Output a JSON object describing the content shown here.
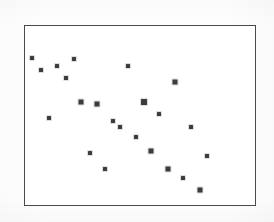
{
  "figure": {
    "background_color": "#fefefe",
    "width": 274,
    "height": 222
  },
  "plot": {
    "frame_color": "#4a4a4a",
    "frame_line_width": 1,
    "plot_background": "#ffffff",
    "marker_color": "#3c3c3c",
    "marker_shape": "square",
    "marker_size": 4,
    "frame_box": {
      "left": 24,
      "top": 25,
      "width": 232,
      "height": 181
    }
  },
  "chart_data": {
    "type": "scatter",
    "title": "",
    "subtitle": "",
    "xlabel": "",
    "ylabel": "",
    "grid": false,
    "legend": false,
    "legend_position": "none",
    "xlim": [
      0,
      100
    ],
    "ylim": [
      0,
      100
    ],
    "xticks": [],
    "yticks": [],
    "xticklabels": [],
    "yticklabels": [],
    "annotations": [],
    "n_points": 23,
    "series": [
      {
        "name": "observations",
        "color": "#3c3c3c",
        "marker": "square",
        "x": [
          3.2,
          6.8,
          13.9,
          21.0,
          17.7,
          44.5,
          64.8,
          24.1,
          31.0,
          51.4,
          10.2,
          38.1,
          41.0,
          57.9,
          48.0,
          71.4,
          27.9,
          54.4,
          78.3,
          34.6,
          61.5,
          68.2,
          75.3
        ],
        "y": [
          82.5,
          75.8,
          77.9,
          81.8,
          71.4,
          77.9,
          68.9,
          57.9,
          56.7,
          57.1,
          48.8,
          38.0,
          34.6,
          41.7,
          28.0,
          34.3,
          14.6,
          15.5,
          12.9,
          5.5,
          4.6,
          0.0,
          -6.4
        ],
        "points_px": [
          {
            "x": 31.3,
            "y": 56.7
          },
          {
            "x": 39.7,
            "y": 68.7
          },
          {
            "x": 56.3,
            "y": 65.0
          },
          {
            "x": 72.7,
            "y": 58.0
          },
          {
            "x": 65.0,
            "y": 76.7
          },
          {
            "x": 127.3,
            "y": 65.0
          },
          {
            "x": 174.3,
            "y": 81.3
          },
          {
            "x": 80.0,
            "y": 101.0
          },
          {
            "x": 96.0,
            "y": 103.3
          },
          {
            "x": 143.3,
            "y": 100.7
          },
          {
            "x": 47.7,
            "y": 117.3
          },
          {
            "x": 112.3,
            "y": 120.3
          },
          {
            "x": 119.0,
            "y": 126.3
          },
          {
            "x": 158.3,
            "y": 113.3
          },
          {
            "x": 135.3,
            "y": 136.3
          },
          {
            "x": 189.7,
            "y": 126.0
          },
          {
            "x": 88.7,
            "y": 151.7
          },
          {
            "x": 150.3,
            "y": 150.0
          },
          {
            "x": 205.7,
            "y": 154.7
          },
          {
            "x": 104.3,
            "y": 167.7
          },
          {
            "x": 166.7,
            "y": 168.3
          },
          {
            "x": 182.3,
            "y": 177.3
          },
          {
            "x": 198.7,
            "y": 189.0
          }
        ],
        "sizes_px": [
          4,
          4,
          4,
          4,
          4,
          4,
          5,
          5,
          5,
          6,
          4,
          4,
          4,
          4,
          4,
          4,
          4,
          5,
          4,
          4,
          5,
          4,
          5
        ]
      }
    ]
  }
}
